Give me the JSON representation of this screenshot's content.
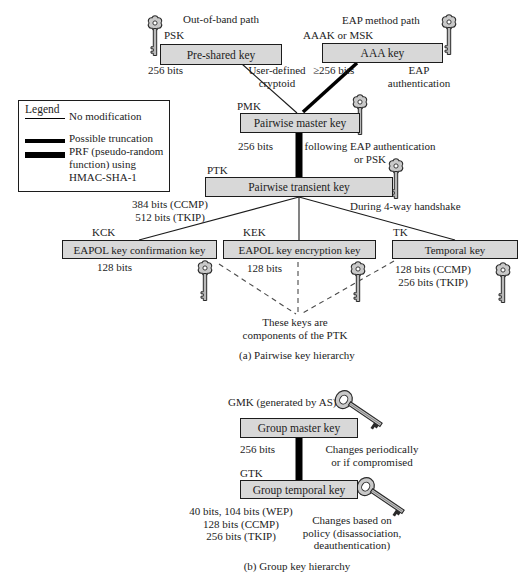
{
  "colors": {
    "background": "#ffffff",
    "box_fill": "#d8d8d8",
    "box_border": "#1c1c1c",
    "key_fill": "#c9c9c9",
    "line": "#000000"
  },
  "legend": {
    "title": "Legend",
    "items": [
      {
        "style": "thin",
        "label": "No modification"
      },
      {
        "style": "medium",
        "label": "Possible truncation"
      },
      {
        "style": "thick",
        "label": "PRF (pseudo-random\nfunction) using\nHMAC-SHA-1"
      }
    ]
  },
  "pairwise": {
    "caption": "(a) Pairwise key hierarchy",
    "out_of_band_path": "Out-of-band path",
    "eap_method_path": "EAP method path",
    "psk_label": "PSK",
    "aaak_label": "AAAK or MSK",
    "pre_shared_key_box": "Pre-shared key",
    "aaa_key_box": "AAA key",
    "pre_shared_bits": "256 bits",
    "user_defined": "User-defined\ncryptoid",
    "aaa_bits": "≥256 bits",
    "eap_auth": "EAP\nauthentication",
    "pmk_label": "PMK",
    "pmk_box": "Pairwise master key",
    "pmk_bits": "256 bits",
    "following_note": "following EAP authentication\nor PSK",
    "ptk_label": "PTK",
    "ptk_box": "Pairwise transient key",
    "ptk_bits": "384 bits (CCMP)\n512 bits (TKIP)",
    "handshake_note": "During 4-way handshake",
    "kck_label": "KCK",
    "kck_box": "EAPOL key confirmation key",
    "kck_bits": "128 bits",
    "kek_label": "KEK",
    "kek_box": "EAPOL key encryption key",
    "kek_bits": "128 bits",
    "tk_label": "TK",
    "tk_box": "Temporal key",
    "tk_bits": "128 bits (CCMP)\n256 bits (TKIP)",
    "components_note": "These keys are\ncomponents of the PTK"
  },
  "group": {
    "caption": "(b) Group key hierarchy",
    "gmk_label": "GMK (generated by AS)",
    "gmk_box": "Group master key",
    "gmk_bits": "256 bits",
    "changes_periodically": "Changes periodically\nor if compromised",
    "gtk_label": "GTK",
    "gtk_box": "Group temporal key",
    "gtk_bits": "40 bits, 104 bits (WEP)\n128 bits (CCMP)\n256 bits (TKIP)",
    "changes_policy": "Changes based on\npolicy (disassociation,\ndeauthentication)"
  }
}
